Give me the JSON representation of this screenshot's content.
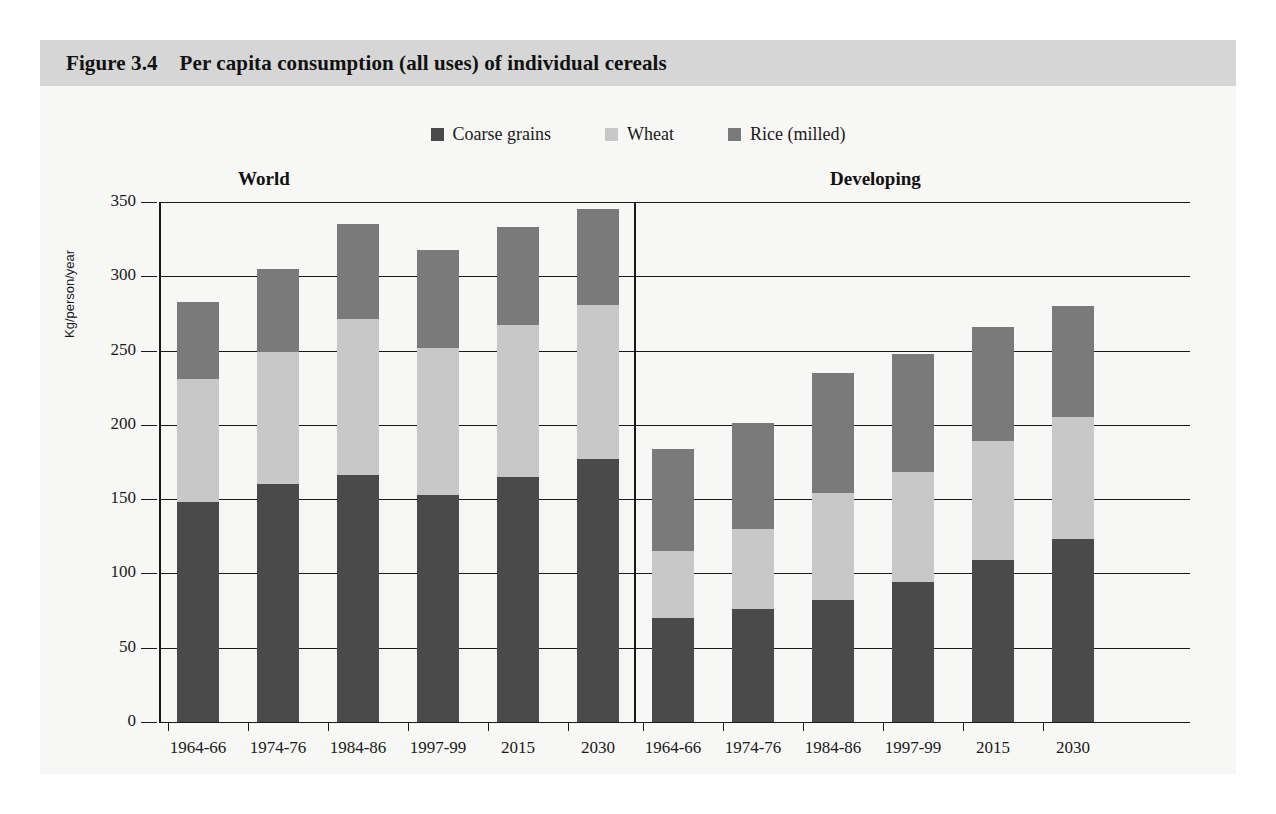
{
  "figure": {
    "number": "Figure 3.4",
    "title": "Per capita consumption (all uses) of individual cereals"
  },
  "colors": {
    "coarse_grains": "#4a4a4a",
    "wheat": "#c8c8c8",
    "rice_milled": "#7a7a7a",
    "title_band": "#d6d6d6",
    "page_background": "#f7f7f5",
    "axis": "#1a1a1a"
  },
  "legend": {
    "position": "top-center",
    "items": [
      {
        "label": "Coarse grains",
        "color": "#4a4a4a"
      },
      {
        "label": "Wheat",
        "color": "#c8c8c8"
      },
      {
        "label": "Rice (milled)",
        "color": "#7a7a7a"
      }
    ]
  },
  "panels": [
    {
      "name": "World",
      "label": "World"
    },
    {
      "name": "Developing",
      "label": "Developing"
    }
  ],
  "axes": {
    "ylabel": "Kg/person/year",
    "yticks": [
      "0",
      "50",
      "100",
      "150",
      "200",
      "250",
      "300",
      "350"
    ],
    "ymin": 0,
    "ymax": 350,
    "ystep": 50
  },
  "chart_data": {
    "type": "bar",
    "title": "Per capita consumption (all uses) of individual cereals",
    "subtitle": "Figure 3.4",
    "stacked": true,
    "xlabel": "",
    "ylabel": "Kg/person/year",
    "ylim": [
      0,
      350
    ],
    "ytick_step": 50,
    "grid": true,
    "legend_position": "top-center",
    "panels": [
      {
        "name": "World",
        "categories": [
          "1964-66",
          "1974-76",
          "1984-86",
          "1997-99",
          "2015",
          "2030"
        ],
        "series": [
          {
            "name": "Coarse grains",
            "color": "#4a4a4a",
            "values": [
              148,
              160,
              166,
              153,
              165,
              177
            ]
          },
          {
            "name": "Wheat",
            "color": "#c8c8c8",
            "values": [
              83,
              89,
              105,
              99,
              102,
              104
            ]
          },
          {
            "name": "Rice (milled)",
            "color": "#7a7a7a",
            "values": [
              52,
              56,
              64,
              66,
              66,
              64
            ]
          }
        ],
        "totals": [
          283,
          305,
          335,
          318,
          333,
          345
        ]
      },
      {
        "name": "Developing",
        "categories": [
          "1964-66",
          "1974-76",
          "1984-86",
          "1997-99",
          "2015",
          "2030"
        ],
        "series": [
          {
            "name": "Coarse grains",
            "color": "#4a4a4a",
            "values": [
              70,
              76,
              82,
              94,
              109,
              123
            ]
          },
          {
            "name": "Wheat",
            "color": "#c8c8c8",
            "values": [
              45,
              54,
              72,
              74,
              80,
              82
            ]
          },
          {
            "name": "Rice (milled)",
            "color": "#7a7a7a",
            "values": [
              69,
              71,
              81,
              80,
              77,
              75
            ]
          }
        ],
        "totals": [
          184,
          201,
          235,
          248,
          266,
          280
        ]
      }
    ]
  }
}
